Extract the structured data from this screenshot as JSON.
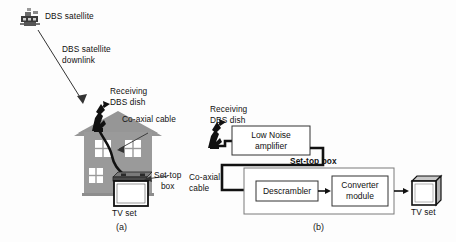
{
  "figure": {
    "panels": [
      {
        "id": "a",
        "caption": "(a)",
        "description": "Pictorial view of DBS reception at a house",
        "labels": {
          "satellite": "DBS satellite",
          "downlink": "DBS satellite\ndownlink",
          "dish": "Receiving\nDBS dish",
          "cable": "Co-axial cable",
          "settop": "Set-top\nbox",
          "tv": "TV set"
        },
        "icons": {
          "satellite": "satellite-icon",
          "dish": "dish-icon",
          "house": "house-icon",
          "tv": "tv-icon",
          "arrow": "downlink-arrow-icon"
        }
      },
      {
        "id": "b",
        "caption": "(b)",
        "description": "Block diagram of DBS receiver chain",
        "labels": {
          "dish": "Receiving\nDBS dish",
          "cable": "Co-axial\ncable",
          "settop": "Set-top box",
          "tv": "TV set"
        },
        "blocks": [
          {
            "name": "low-noise-amplifier",
            "text": "Low Noise\namplifier"
          },
          {
            "name": "descrambler",
            "text": "Descrambler"
          },
          {
            "name": "converter-module",
            "text": "Converter\nmodule"
          }
        ],
        "icons": {
          "dish": "dish-icon",
          "tv": "tv-icon",
          "signal-arrow": "signal-arrow-icon"
        }
      }
    ]
  },
  "colors": {
    "house_body": "#9a9a9a",
    "roof": "#8e8e8e",
    "window": "#ffffff",
    "line": "#1a1a1a",
    "cable": "#111111",
    "background": "#fdfdfd",
    "box_fill": "#ffffff",
    "tv_screen": "#ffffff"
  }
}
